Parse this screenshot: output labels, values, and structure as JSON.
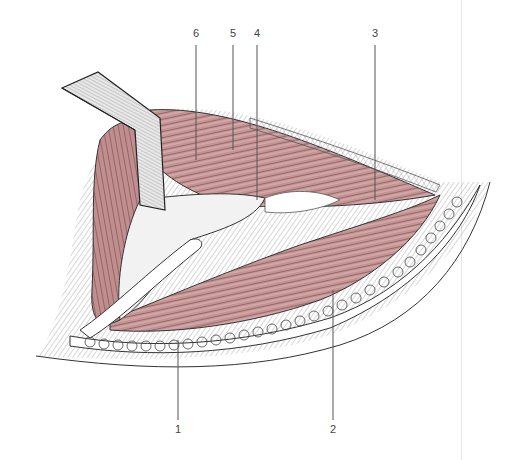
{
  "figure": {
    "type": "anatomical-illustration",
    "style": "cross-hatched engraving with pink-tinted muscle",
    "colors": {
      "muscle": "#c99a9a",
      "muscle_dark": "#7a4a4a",
      "ink": "#333333",
      "fat": "#ffffff",
      "hatch": "#8a8a8a"
    },
    "labels": [
      {
        "id": "1",
        "text": "1",
        "x": 178,
        "y": 428,
        "leader_to": [
          178,
          340
        ]
      },
      {
        "id": "2",
        "text": "2",
        "x": 333,
        "y": 428,
        "leader_to": [
          333,
          290
        ]
      },
      {
        "id": "3",
        "text": "3",
        "x": 375,
        "y": 33,
        "leader_to": [
          375,
          200
        ]
      },
      {
        "id": "4",
        "text": "4",
        "x": 257,
        "y": 33,
        "leader_to": [
          257,
          200
        ]
      },
      {
        "id": "5",
        "text": "5",
        "x": 233,
        "y": 33,
        "leader_to": [
          233,
          150
        ]
      },
      {
        "id": "6",
        "text": "6",
        "x": 196,
        "y": 33,
        "leader_to": [
          196,
          160
        ]
      }
    ]
  }
}
